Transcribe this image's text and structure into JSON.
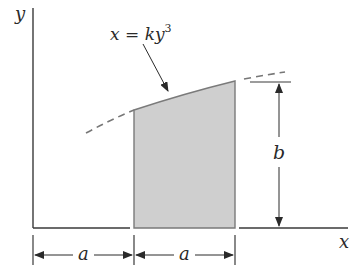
{
  "diagram": {
    "axes": {
      "y_label": "y",
      "x_label": "x"
    },
    "curve": {
      "equation_base": "x = ky",
      "equation_exponent": "3"
    },
    "dimensions": {
      "height_label": "b",
      "left_width_label": "a",
      "right_width_label": "a"
    },
    "colors": {
      "line": "#3a3a3a",
      "shaded_fill": "#cfcfcf",
      "shaded_edge": "#7a7a7a",
      "dashed_curve": "#777777",
      "background": "#ffffff"
    }
  }
}
